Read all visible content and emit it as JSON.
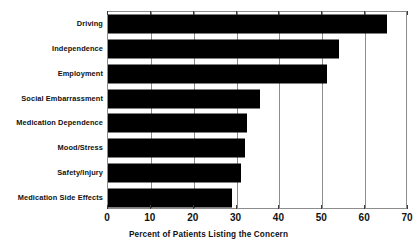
{
  "chart_data": {
    "type": "bar",
    "orientation": "horizontal",
    "title": "",
    "xlabel": "Percent of Patients Listing the Concern",
    "ylabel": "",
    "xlim": [
      0,
      70
    ],
    "xticks": [
      0,
      10,
      20,
      30,
      40,
      50,
      60,
      70
    ],
    "grid": true,
    "legend": false,
    "bar_color": "#000000",
    "frame_color": "#8d8d8d",
    "categories": [
      "Driving",
      "Independence",
      "Employment",
      "Social Embarrassment",
      "Medication Dependence",
      "Mood/Stress",
      "Safety/Injury",
      "Medication Side Effects"
    ],
    "values": [
      65,
      54,
      51,
      35.5,
      32.5,
      32,
      31,
      29
    ]
  },
  "axis": {
    "tick_labels": [
      "0",
      "10",
      "20",
      "30",
      "40",
      "50",
      "60",
      "70"
    ],
    "title": "Percent of Patients Listing the Concern"
  }
}
